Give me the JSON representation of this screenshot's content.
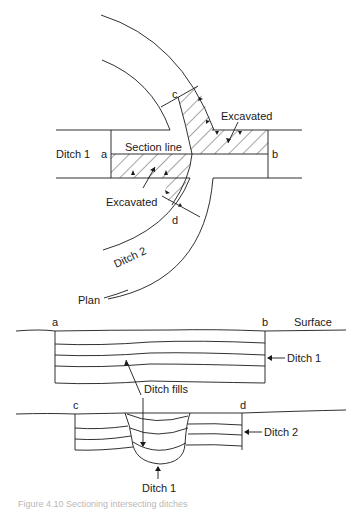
{
  "plan": {
    "title": "Plan",
    "ditch1_label": "Ditch 1",
    "ditch2_label": "Ditch 2",
    "section_line_label": "Section line",
    "excavated_upper_label": "Excavated",
    "excavated_lower_label": "Excavated",
    "point_a": "a",
    "point_b": "b",
    "point_c": "c",
    "point_d": "d"
  },
  "section_ab": {
    "point_a": "a",
    "point_b": "b",
    "surface_label": "Surface",
    "ditch_label": "Ditch 1",
    "fills_label": "Ditch fills"
  },
  "section_cd": {
    "point_c": "c",
    "point_d": "d",
    "ditch2_label": "Ditch 2",
    "ditch1_label": "Ditch 1"
  },
  "caption": "Figure 4.10   Sectioning intersecting ditches",
  "colors": {
    "line": "#1a1a1a",
    "background": "#ffffff"
  }
}
